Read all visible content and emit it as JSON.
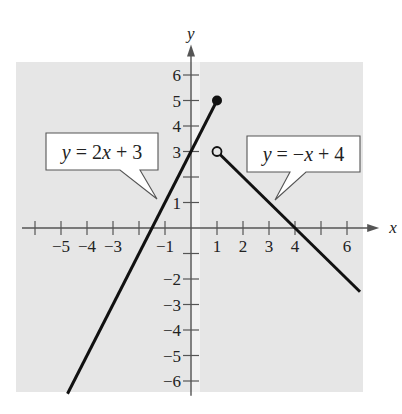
{
  "chart_data": {
    "type": "line",
    "title": "",
    "xlabel": "x",
    "ylabel": "y",
    "xlim": [
      -6.5,
      6.7
    ],
    "ylim": [
      -6.5,
      6.8
    ],
    "grid": false,
    "x_ticks": [
      -6,
      -5,
      -4,
      -3,
      -2,
      -1,
      1,
      2,
      3,
      4,
      5,
      6
    ],
    "x_tick_labels": [
      {
        "value": -5,
        "label": "−5"
      },
      {
        "value": -4,
        "label": "−4"
      },
      {
        "value": -3,
        "label": "−3"
      },
      {
        "value": -1,
        "label": "−1"
      },
      {
        "value": 1,
        "label": "1"
      },
      {
        "value": 2,
        "label": "2"
      },
      {
        "value": 3,
        "label": "3"
      },
      {
        "value": 4,
        "label": "4"
      },
      {
        "value": 6,
        "label": "6"
      }
    ],
    "y_ticks": [
      -6,
      -5,
      -4,
      -3,
      -2,
      -1,
      1,
      2,
      3,
      4,
      5,
      6
    ],
    "y_tick_labels": [
      {
        "value": 6,
        "label": "6"
      },
      {
        "value": 5,
        "label": "5"
      },
      {
        "value": 4,
        "label": "4"
      },
      {
        "value": 3,
        "label": "3"
      },
      {
        "value": 1,
        "label": "1"
      },
      {
        "value": -2,
        "label": "−2"
      },
      {
        "value": -3,
        "label": "−3"
      },
      {
        "value": -4,
        "label": "−4"
      },
      {
        "value": -5,
        "label": "−5"
      },
      {
        "value": -6,
        "label": "−6"
      }
    ],
    "series": [
      {
        "name": "y = 2x + 3",
        "equation": "y = 2x + 3",
        "domain": "x ≤ 1",
        "points": [
          [
            -4.75,
            -6.5
          ],
          [
            1,
            5
          ]
        ],
        "endpoint": {
          "x": 1,
          "y": 5,
          "style": "closed"
        }
      },
      {
        "name": "y = −x + 4",
        "equation": "y = −x + 4",
        "domain": "x > 1",
        "points": [
          [
            1,
            3
          ],
          [
            6.5,
            -2.5
          ]
        ],
        "endpoint": {
          "x": 1,
          "y": 3,
          "style": "open"
        }
      }
    ],
    "annotations": [
      {
        "text_y": "y",
        "text_rest": " = 2",
        "text_x": "x",
        "text_tail": " + 3",
        "full": "y = 2x + 3",
        "points_to": [
          -0.9,
          1.2
        ]
      },
      {
        "text_y": "y",
        "text_rest": " = −",
        "text_x": "x",
        "text_tail": " + 4",
        "full": "y = −x + 4",
        "points_to": [
          3.2,
          1.1
        ]
      }
    ]
  },
  "colors": {
    "background": "#e6e6e6",
    "line": "#111111",
    "axis": "#555555"
  }
}
